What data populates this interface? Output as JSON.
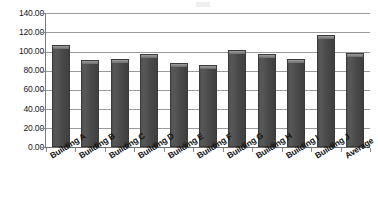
{
  "chart_data": {
    "type": "bar",
    "title": "",
    "subtitle": "",
    "xlabel": "",
    "ylabel": "",
    "categories": [
      "Building A",
      "Building B",
      "Building C",
      "Building D",
      "Building E",
      "Building F",
      "Building G",
      "Building H",
      "Building I",
      "Building J",
      "Average"
    ],
    "values": [
      107,
      91,
      92,
      97,
      88,
      86,
      101,
      97,
      92,
      117,
      98
    ],
    "ylim": [
      0,
      140
    ],
    "ytick_step": 20,
    "ytick_labels": [
      "140.00",
      "120.00",
      "100.00",
      "80.00",
      "60.00",
      "40.00",
      "20.00",
      "0.00"
    ],
    "ytick_values": [
      140,
      120,
      100,
      80,
      60,
      40,
      20,
      0
    ],
    "grid": true,
    "legend": false,
    "legend_position": "none",
    "series": [
      {
        "name": "",
        "values": [
          107,
          91,
          92,
          97,
          88,
          86,
          101,
          97,
          92,
          117,
          98
        ],
        "color": "#4a4a4a"
      }
    ],
    "bar_color": "#4a4a4a",
    "gridline_color": "#9a9a9a",
    "axis_color": "#7d7d7d",
    "background": "#ffffff"
  }
}
